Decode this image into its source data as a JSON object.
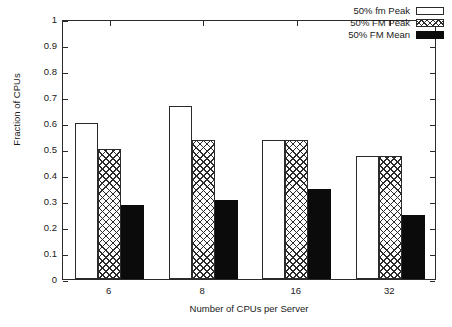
{
  "chart_data": {
    "type": "bar",
    "title": "",
    "xlabel": "Number of CPUs per Server",
    "ylabel": "Fraction of CPUs",
    "categories": [
      "6",
      "8",
      "16",
      "32"
    ],
    "ylim": [
      0,
      1
    ],
    "yticks": [
      "0",
      "0.1",
      "0.2",
      "0.3",
      "0.4",
      "0.5",
      "0.6",
      "0.7",
      "0.8",
      "0.9",
      "1"
    ],
    "ytick_values": [
      0,
      0.1,
      0.2,
      0.3,
      0.4,
      0.5,
      0.6,
      0.7,
      0.8,
      0.9,
      1
    ],
    "grid": false,
    "legend_position": "top-right",
    "series": [
      {
        "name": "50% fm Peak",
        "style": "open-white",
        "values": [
          0.6,
          0.665,
          0.535,
          0.472
        ]
      },
      {
        "name": "50% FM Peak",
        "style": "crosshatch",
        "values": [
          0.5,
          0.535,
          0.535,
          0.472
        ]
      },
      {
        "name": "50% FM Mean",
        "style": "solid-black",
        "values": [
          0.285,
          0.304,
          0.347,
          0.246
        ]
      }
    ]
  },
  "legend": {
    "items": [
      {
        "label": "50% fm Peak"
      },
      {
        "label": "50% FM Peak"
      },
      {
        "label": "50% FM Mean"
      }
    ]
  },
  "colors": {
    "axis": "#2b2b2b",
    "text": "#1a1a1a",
    "solid_black": "#0b0b0b",
    "background": "#ffffff"
  }
}
